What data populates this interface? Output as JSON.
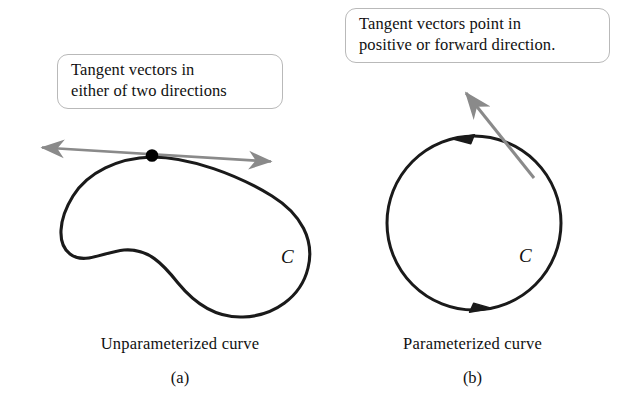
{
  "figure": {
    "background_color": "#ffffff",
    "curve_color": "#1a1a1a",
    "tangent_vector_color": "#8a8a8a",
    "callout_border_color": "#b9b9b9",
    "point_color": "#000000"
  },
  "panel_a": {
    "callout_text": "Tangent vectors in\neither of two directions",
    "caption": "Unparameterized curve",
    "letter": "(a)",
    "curve_label": "C",
    "curve_type": "closed blob, no orientation",
    "tangent_arrow": {
      "style": "double-headed",
      "name": "bidirectional tangent vector",
      "color": "#8a8a8a",
      "tip_left": [
        38,
        147
      ],
      "tip_right": [
        276,
        162
      ]
    },
    "tangent_point": {
      "name": "point of tangency",
      "coords": [
        152,
        155
      ],
      "radius": 6
    }
  },
  "panel_b": {
    "callout_text": "Tangent vectors point in\npositive or forward direction.",
    "caption": "Parameterized curve",
    "letter": "(b)",
    "curve_label": "C",
    "curve_type": "circle with orientation arrowheads",
    "orientation": "clockwise",
    "circle": {
      "center": [
        474,
        223
      ],
      "radius": 87
    },
    "direction_arrowheads": [
      {
        "name": "top-orientation-arrowhead",
        "points": "left",
        "coords": [
          468,
          137
        ]
      },
      {
        "name": "bottom-orientation-arrowhead",
        "points": "right",
        "coords": [
          472,
          310
        ]
      }
    ],
    "tangent_arrow": {
      "style": "single-headed",
      "name": "forward tangent vector",
      "color": "#8a8a8a",
      "tail": [
        533,
        176
      ],
      "tip": [
        462,
        88
      ]
    }
  }
}
